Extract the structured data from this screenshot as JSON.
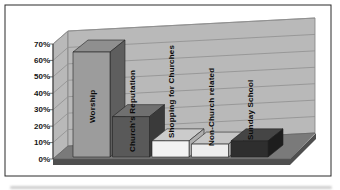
{
  "chart_data": {
    "type": "bar",
    "projection": "3d",
    "title": "",
    "xlabel": "",
    "ylabel": "",
    "legend": "none",
    "grid": true,
    "categories": [
      "Worship",
      "Church's Reputation",
      "Shopping for Churches",
      "Non-Church related",
      "Sunday School"
    ],
    "values": [
      65,
      25,
      10,
      8,
      10
    ],
    "unit": "%",
    "ylim": [
      0,
      70
    ],
    "y_ticks": [
      "0%",
      "10%",
      "20%",
      "30%",
      "40%",
      "50%",
      "60%",
      "70%"
    ],
    "colors": {
      "wall": "#b9b9b9",
      "floor": "#7a7a7a",
      "floor_edge": "#4f4f4f",
      "gridline": "#8f8f8f",
      "axis_line": "#333333",
      "frame_border": "#2a2a2a",
      "bar_outline": "#222222",
      "bars": [
        {
          "front": "#9c9c9c",
          "top": "#8f8f8f",
          "side": "#5e5e5e"
        },
        {
          "front": "#595959",
          "top": "#707070",
          "side": "#3a3a3a"
        },
        {
          "front": "#f2f2f2",
          "top": "#cbcbcb",
          "side": "#aeaeae"
        },
        {
          "front": "#ededed",
          "top": "#c6c6c6",
          "side": "#a8a8a8"
        },
        {
          "front": "#2e2e2e",
          "top": "#454545",
          "side": "#1d1d1d"
        }
      ]
    }
  }
}
